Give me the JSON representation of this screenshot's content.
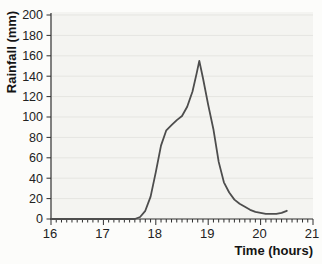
{
  "chart_data": {
    "type": "line",
    "title": "",
    "xlabel": "Time (hours)",
    "ylabel": "Rainfall (mm)",
    "xlim": [
      16,
      21
    ],
    "ylim": [
      0,
      200
    ],
    "x_ticks": [
      16,
      17,
      18,
      19,
      20,
      21
    ],
    "x_minor_tick_step": 0.1,
    "y_ticks": [
      0,
      20,
      40,
      60,
      80,
      100,
      120,
      140,
      160,
      180,
      200
    ],
    "grid": "horizontal",
    "legend": "none",
    "series": [
      {
        "name": "rainfall",
        "x": [
          16.0,
          16.5,
          17.0,
          17.5,
          17.6,
          17.7,
          17.8,
          17.9,
          18.0,
          18.1,
          18.2,
          18.3,
          18.4,
          18.5,
          18.6,
          18.7,
          18.78,
          18.83,
          18.9,
          19.0,
          19.1,
          19.2,
          19.3,
          19.4,
          19.5,
          19.6,
          19.7,
          19.8,
          19.9,
          20.0,
          20.1,
          20.2,
          20.3,
          20.4,
          20.5
        ],
        "y": [
          0,
          0,
          0,
          0,
          0,
          2,
          8,
          22,
          46,
          72,
          87,
          92,
          97,
          101,
          110,
          125,
          143,
          155,
          138,
          112,
          88,
          56,
          36,
          26,
          19,
          15,
          12,
          9,
          7,
          6,
          5,
          5,
          5,
          6,
          8
        ]
      }
    ],
    "annotations": {
      "peak_value_mm": 155,
      "peak_time_hours": 18.83
    },
    "colors": {
      "line": "#4d4d4d",
      "axis": "#2e2e2e",
      "grid": "#e5e5e1",
      "plot_bg": "#f4f4f1",
      "page_bg": "#fcfcfa",
      "text": "#222222"
    }
  }
}
